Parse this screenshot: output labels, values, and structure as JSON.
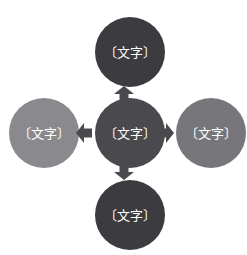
{
  "canvas": {
    "width": 247,
    "height": 255,
    "background": "#ffffff"
  },
  "diagram": {
    "type": "hub-and-spoke-cross",
    "colors": {
      "center_fill": "#4a4a4e",
      "top_fill": "#3b3b40",
      "bottom_fill": "#3b3b40",
      "left_fill": "#8a8a8e",
      "right_fill": "#77777b",
      "arrow_fill": "#4a4a4e",
      "label_text": "#ffffff",
      "background": "#ffffff"
    },
    "nodes": [
      {
        "id": "center",
        "label": "〔文字〕",
        "position": "center",
        "fill": "#4a4a4e"
      },
      {
        "id": "top",
        "label": "〔文字〕",
        "position": "top",
        "fill": "#3b3b40"
      },
      {
        "id": "right",
        "label": "〔文字〕",
        "position": "right",
        "fill": "#77777b"
      },
      {
        "id": "bottom",
        "label": "〔文字〕",
        "position": "bottom",
        "fill": "#3b3b40"
      },
      {
        "id": "left",
        "label": "〔文字〕",
        "position": "left",
        "fill": "#8a8a8e"
      }
    ],
    "arrows": [
      {
        "id": "arrow-up",
        "direction": "up",
        "from": "center",
        "to": "top"
      },
      {
        "id": "arrow-right",
        "direction": "right",
        "from": "center",
        "to": "right"
      },
      {
        "id": "arrow-down",
        "direction": "down",
        "from": "center",
        "to": "bottom"
      },
      {
        "id": "arrow-left",
        "direction": "left",
        "from": "center",
        "to": "left"
      }
    ]
  }
}
